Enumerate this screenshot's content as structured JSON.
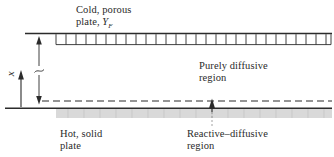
{
  "figure": {
    "type": "technical-diagram",
    "background_color": "#ffffff",
    "line_color": "#2b2b2b",
    "plate_fill_color": "#d9d9d9",
    "text_color": "#2a2a2a"
  },
  "labels": {
    "cold_plate_line1": "Cold, porous",
    "cold_plate_line2_prefix": "plate, ",
    "cold_plate_symbol": "Y",
    "cold_plate_symbol_sub": "F",
    "hot_plate_line1": "Hot, solid",
    "hot_plate_line2": "plate",
    "purely_diffusive_line1": "Purely diffusive",
    "purely_diffusive_line2": "region",
    "reactive_diffusive_line1": "Reactive–diffusive",
    "reactive_diffusive_line2": "region",
    "axis_symbol": "x"
  },
  "geometry": {
    "top_plate_line_y": 33,
    "top_plate_line_x_start": 25,
    "top_plate_line_x_end": 332,
    "porous_ladder_x_start": 56,
    "porous_ladder_x_end": 331,
    "porous_ladder_top": 34,
    "porous_ladder_bottom": 45,
    "porous_cell_count": 27,
    "bottom_plate_line_y": 108,
    "bottom_plate_line_x_start": 5,
    "bottom_plate_line_x_end": 332,
    "solid_plate_band_top": 109,
    "solid_plate_band_bottom": 118,
    "dashed_line_y": 101,
    "dashed_line_x_start": 42,
    "dashed_line_x_end": 332,
    "dimension_arrow_x": 39,
    "dimension_arrow_top": 37,
    "dimension_arrow_bottom": 104,
    "dimension_break_y": 70,
    "axis_arrow_x": 21,
    "axis_arrow_top": 72,
    "axis_arrow_bottom": 107,
    "reactive_pointer_x": 212,
    "reactive_pointer_tip_y": 100,
    "reactive_pointer_base_y": 126
  }
}
